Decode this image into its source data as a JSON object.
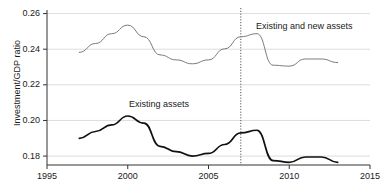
{
  "chart_data": {
    "type": "line",
    "title": "",
    "xlabel": "",
    "ylabel": "Investment/GDP ratio",
    "xlim": [
      1995,
      2015
    ],
    "ylim": [
      0.175,
      0.262
    ],
    "grid": true,
    "legend_position": "inline-annotations",
    "x_ticks": [
      "1995",
      "2000",
      "2005",
      "2010",
      "2015"
    ],
    "y_ticks": [
      "0.18",
      "0.20",
      "0.22",
      "0.24",
      "0.26"
    ],
    "x_tick_values": [
      1995,
      2000,
      2005,
      2010,
      2015
    ],
    "y_tick_values": [
      0.18,
      0.2,
      0.22,
      0.24,
      0.26
    ],
    "x": [
      1997,
      1998,
      1999,
      2000,
      2001,
      2002,
      2003,
      2004,
      2005,
      2006,
      2007,
      2008,
      2009,
      2010,
      2011,
      2012,
      2013
    ],
    "series": [
      {
        "name": "Existing and new assets",
        "color": "#7a7a7a",
        "values": [
          0.2382,
          0.2432,
          0.2487,
          0.2535,
          0.247,
          0.2368,
          0.234,
          0.2318,
          0.234,
          0.2402,
          0.247,
          0.2487,
          0.231,
          0.2305,
          0.2345,
          0.2345,
          0.2325
        ]
      },
      {
        "name": "Existing assets",
        "color": "#111111",
        "values": [
          0.19,
          0.1938,
          0.1975,
          0.2025,
          0.1985,
          0.1855,
          0.1825,
          0.18,
          0.1815,
          0.1865,
          0.193,
          0.1945,
          0.1775,
          0.1765,
          0.1795,
          0.1795,
          0.1765
        ]
      }
    ],
    "annotations": [
      {
        "text": "Existing assets",
        "x": 2003,
        "y": 0.2115
      },
      {
        "text": "Existing and new assets",
        "x": 2010,
        "y": 0.257
      }
    ],
    "vertical_marker": {
      "x": 2007,
      "style": "dotted",
      "color": "#555555"
    }
  },
  "axes": {
    "y_title": "Investment/GDP ratio"
  }
}
